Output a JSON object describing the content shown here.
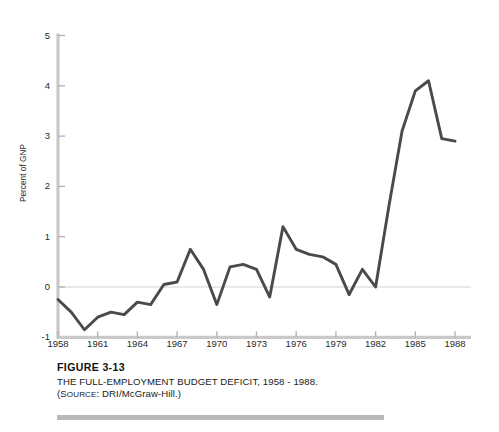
{
  "figure": {
    "number": "FIGURE 3-13",
    "title": "THE FULL-EMPLOYMENT BUDGET DEFICIT, 1958 - 1988.",
    "source_prefix": "(S",
    "source_smallcaps": "OURCE",
    "source_rest": ": DRI/McGraw-Hill.)"
  },
  "colors": {
    "line": "#4a4a4a",
    "axis": "#c9c9c9",
    "zero_line": "#e2e2e2",
    "tick": "#b5b5b5",
    "rule": "#b9b9b9",
    "text": "#1a1a1a",
    "background": "#ffffff"
  },
  "chart_data": {
    "type": "line",
    "title": "THE FULL-EMPLOYMENT BUDGET DEFICIT, 1958 - 1988.",
    "xlabel": "",
    "ylabel": "Percent of GNP",
    "xlim": [
      1958,
      1988
    ],
    "ylim": [
      -1,
      5
    ],
    "yticks": [
      -1,
      0,
      1,
      2,
      3,
      4,
      5
    ],
    "ytick_labels": [
      "-1",
      "0",
      "1",
      "2",
      "3",
      "4",
      "5"
    ],
    "xticks": [
      1958,
      1961,
      1964,
      1967,
      1970,
      1973,
      1976,
      1979,
      1982,
      1985,
      1988
    ],
    "xtick_labels": [
      "1958",
      "1961",
      "1964",
      "1967",
      "1970",
      "1973",
      "1976",
      "1979",
      "1982",
      "1985",
      "1988"
    ],
    "grid": false,
    "zero_reference_line": true,
    "legend": "none",
    "x": [
      1958,
      1959,
      1960,
      1961,
      1962,
      1963,
      1964,
      1965,
      1966,
      1967,
      1968,
      1969,
      1970,
      1971,
      1972,
      1973,
      1974,
      1975,
      1976,
      1977,
      1978,
      1979,
      1980,
      1981,
      1982,
      1983,
      1984,
      1985,
      1986,
      1987,
      1988
    ],
    "values": [
      -0.25,
      -0.5,
      -0.85,
      -0.6,
      -0.5,
      -0.55,
      -0.3,
      -0.35,
      0.05,
      0.1,
      0.75,
      0.35,
      -0.35,
      0.4,
      0.45,
      0.35,
      -0.2,
      1.2,
      0.75,
      0.65,
      0.6,
      0.45,
      -0.15,
      0.35,
      0.0,
      1.6,
      3.1,
      3.9,
      4.1,
      2.95,
      2.9
    ],
    "series_name": "Full-employment budget deficit"
  }
}
